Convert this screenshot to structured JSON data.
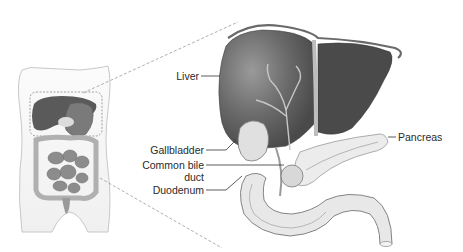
{
  "diagram": {
    "colors": {
      "liver_dark": "#4a4a4a",
      "liver_mid": "#6b6b6b",
      "liver_light": "#8a8a8a",
      "outline": "#555555",
      "tissue_light": "#e4e4e4",
      "body_fill": "#f2f2f2",
      "dash": "#9a9a9a",
      "label_text": "#2a2a2a"
    },
    "labels": {
      "liver": "Liver",
      "gallbladder": "Gallbladder",
      "common_bile_duct_line1": "Common bile",
      "common_bile_duct_line2": "duct",
      "duodenum": "Duodenum",
      "pancreas": "Pancreas"
    }
  }
}
